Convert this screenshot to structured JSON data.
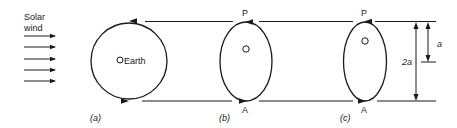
{
  "diagram": {
    "solar_wind": {
      "line1": "Solar",
      "line2": "wind",
      "arrow_count": 5
    },
    "panels": [
      {
        "id": "a",
        "caption": "(a)",
        "shape": "circle",
        "center_label": "Earth"
      },
      {
        "id": "b",
        "caption": "(b)",
        "shape": "ellipse",
        "top_label": "P",
        "bottom_label": "A",
        "focus_marker": "O"
      },
      {
        "id": "c",
        "caption": "(c)",
        "shape": "ellipse",
        "top_label": "P",
        "bottom_label": "A",
        "focus_marker": "O"
      }
    ],
    "dimensions": {
      "full": "2a",
      "half": "a"
    },
    "colors": {
      "ink": "#1a1a1a",
      "background": "#ffffff"
    }
  }
}
